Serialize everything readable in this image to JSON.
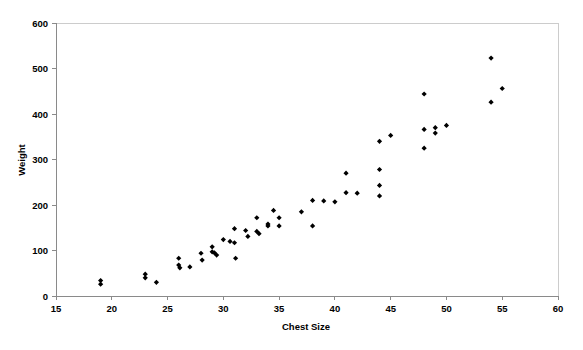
{
  "chart_data": {
    "type": "scatter",
    "title": "",
    "xlabel": "Chest Size",
    "ylabel": "Weight",
    "xlim": [
      15,
      60
    ],
    "ylim": [
      0,
      600
    ],
    "xticks": [
      15,
      20,
      25,
      30,
      35,
      40,
      45,
      50,
      55,
      60
    ],
    "yticks": [
      0,
      100,
      200,
      300,
      400,
      500,
      600
    ],
    "xtick_labels": [
      "15",
      "20",
      "25",
      "30",
      "35",
      "40",
      "45",
      "50",
      "55",
      "60"
    ],
    "ytick_labels": [
      "0",
      "100",
      "200",
      "300",
      "400",
      "500",
      "600"
    ],
    "grid": false,
    "legend": null,
    "marker": "diamond",
    "marker_color": "#000000",
    "points": [
      {
        "x": 19.0,
        "y": 34
      },
      {
        "x": 19.0,
        "y": 26
      },
      {
        "x": 23.0,
        "y": 48
      },
      {
        "x": 23.0,
        "y": 40
      },
      {
        "x": 24.0,
        "y": 30
      },
      {
        "x": 26.0,
        "y": 83
      },
      {
        "x": 26.0,
        "y": 68
      },
      {
        "x": 26.1,
        "y": 62
      },
      {
        "x": 27.0,
        "y": 64
      },
      {
        "x": 28.0,
        "y": 94
      },
      {
        "x": 28.1,
        "y": 79
      },
      {
        "x": 29.0,
        "y": 108
      },
      {
        "x": 29.0,
        "y": 97
      },
      {
        "x": 29.2,
        "y": 95
      },
      {
        "x": 29.4,
        "y": 90
      },
      {
        "x": 30.0,
        "y": 124
      },
      {
        "x": 30.6,
        "y": 120
      },
      {
        "x": 31.0,
        "y": 117
      },
      {
        "x": 31.0,
        "y": 148
      },
      {
        "x": 31.1,
        "y": 83
      },
      {
        "x": 32.0,
        "y": 144
      },
      {
        "x": 32.2,
        "y": 131
      },
      {
        "x": 33.0,
        "y": 172
      },
      {
        "x": 33.0,
        "y": 142
      },
      {
        "x": 33.2,
        "y": 137
      },
      {
        "x": 34.0,
        "y": 158
      },
      {
        "x": 34.0,
        "y": 154
      },
      {
        "x": 34.5,
        "y": 188
      },
      {
        "x": 35.0,
        "y": 172
      },
      {
        "x": 35.0,
        "y": 154
      },
      {
        "x": 37.0,
        "y": 185
      },
      {
        "x": 38.0,
        "y": 210
      },
      {
        "x": 38.0,
        "y": 154
      },
      {
        "x": 39.0,
        "y": 209
      },
      {
        "x": 40.0,
        "y": 207
      },
      {
        "x": 41.0,
        "y": 270
      },
      {
        "x": 41.0,
        "y": 227
      },
      {
        "x": 42.0,
        "y": 226
      },
      {
        "x": 44.0,
        "y": 340
      },
      {
        "x": 44.0,
        "y": 278
      },
      {
        "x": 44.0,
        "y": 243
      },
      {
        "x": 44.0,
        "y": 220
      },
      {
        "x": 45.0,
        "y": 353
      },
      {
        "x": 48.0,
        "y": 444
      },
      {
        "x": 48.0,
        "y": 366
      },
      {
        "x": 48.0,
        "y": 325
      },
      {
        "x": 49.0,
        "y": 370
      },
      {
        "x": 49.0,
        "y": 358
      },
      {
        "x": 50.0,
        "y": 375
      },
      {
        "x": 54.0,
        "y": 523
      },
      {
        "x": 54.0,
        "y": 426
      },
      {
        "x": 55.0,
        "y": 456
      }
    ]
  },
  "axes": {
    "x_title": "Chest Size",
    "y_title": "Weight"
  }
}
